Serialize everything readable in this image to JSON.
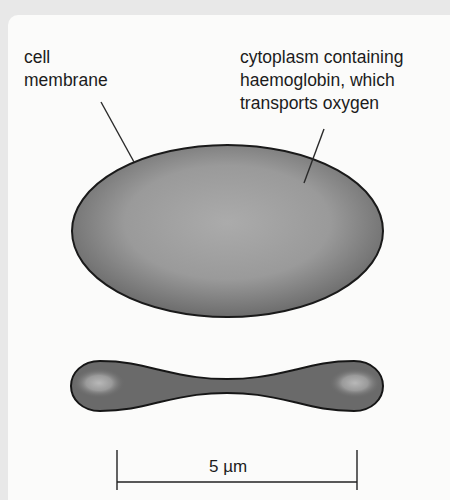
{
  "diagram": {
    "labels": {
      "membrane": "cell\nmembrane",
      "cytoplasm": "cytoplasm containing\nhaemoglobin, which\ntransports oxygen"
    },
    "views": [
      {
        "name": "face view",
        "shape": "ellipse"
      },
      {
        "name": "cross-section view",
        "shape": "biconcave dumbbell"
      }
    ],
    "scale_bar": {
      "label": "5 µm",
      "value": 5,
      "unit": "µm"
    },
    "colors": {
      "background": "#e8e8e8",
      "panel": "#fbfbfa",
      "cell_center": "#ababab",
      "cell_edge": "#6a6a6a",
      "outline": "#1a1a1a"
    }
  }
}
